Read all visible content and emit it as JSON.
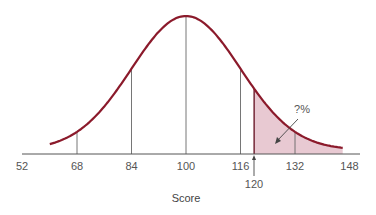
{
  "chart_data": {
    "type": "area",
    "title": "",
    "xlabel": "Score",
    "ylabel": "",
    "distribution": {
      "kind": "normal",
      "mean": 100,
      "sd": 16
    },
    "xlim": [
      52,
      148
    ],
    "tick_labels": [
      "52",
      "68",
      "84",
      "100",
      "116",
      "132",
      "148"
    ],
    "marked_value": {
      "label": "120",
      "x": 120
    },
    "vertical_lines": [
      68,
      84,
      100,
      116,
      120,
      132
    ],
    "shaded_region": {
      "from": 120,
      "to": 148,
      "color": "#e8c9d2"
    },
    "annotation": "?%",
    "curve_color": "#8b1a2b",
    "grid": false,
    "legend": null
  }
}
